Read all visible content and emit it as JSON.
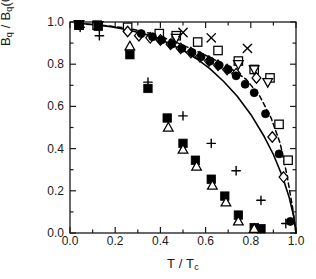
{
  "chart_data": {
    "type": "scatter",
    "title": "",
    "xlabel": "T / Tc",
    "ylabel": "Bq / Bq(0)",
    "xlabel_parts": {
      "num": "T",
      "den": "T",
      "den_sub": "c"
    },
    "ylabel_parts": {
      "num": "B",
      "num_sub": "q",
      "den": "B",
      "den_sub": "q",
      "den_arg": "(0)"
    },
    "xlim": [
      0.0,
      1.0
    ],
    "ylim": [
      0.0,
      1.0
    ],
    "xticks": [
      "0.0",
      "0.2",
      "0.4",
      "0.6",
      "0.8",
      "1.0"
    ],
    "xtick_values": [
      0.0,
      0.2,
      0.4,
      0.6,
      0.8,
      1.0
    ],
    "yticks": [
      "0.0",
      "0.2",
      "0.4",
      "0.6",
      "0.8",
      "1.0"
    ],
    "ytick_values": [
      0.0,
      0.2,
      0.4,
      0.6,
      0.8,
      1.0
    ],
    "minor_ticks": true,
    "grid": false,
    "legend": "none",
    "frame": "box",
    "axis_color": "#1a1a1a",
    "series": [
      {
        "name": "open-square",
        "marker": "square-open",
        "color": "#000000",
        "points": [
          [
            0.04,
            0.985
          ],
          [
            0.12,
            0.985
          ],
          [
            0.255,
            0.975
          ],
          [
            0.395,
            0.945
          ],
          [
            0.47,
            0.935
          ],
          [
            0.565,
            0.905
          ],
          [
            0.655,
            0.865
          ],
          [
            0.745,
            0.815
          ],
          [
            0.815,
            0.775
          ],
          [
            0.885,
            0.735
          ],
          [
            0.925,
            0.515
          ],
          [
            0.965,
            0.345
          ]
        ]
      },
      {
        "name": "open-triangle-down",
        "marker": "triangle-down-open",
        "color": "#000000",
        "points": [
          [
            0.04,
            0.99
          ],
          [
            0.125,
            0.985
          ],
          [
            0.47,
            0.925
          ],
          [
            0.745,
            0.8
          ],
          [
            0.815,
            0.775
          ],
          [
            0.875,
            0.715
          ]
        ]
      },
      {
        "name": "open-diamond",
        "marker": "diamond-open",
        "color": "#000000",
        "points": [
          [
            0.255,
            0.955
          ],
          [
            0.305,
            0.935
          ],
          [
            0.355,
            0.925
          ],
          [
            0.4,
            0.915
          ],
          [
            0.445,
            0.895
          ],
          [
            0.49,
            0.875
          ],
          [
            0.535,
            0.855
          ],
          [
            0.575,
            0.835
          ],
          [
            0.615,
            0.815
          ],
          [
            0.655,
            0.795
          ],
          [
            0.695,
            0.775
          ],
          [
            0.735,
            0.755
          ],
          [
            0.825,
            0.735
          ],
          [
            0.895,
            0.455
          ],
          [
            0.945,
            0.265
          ]
        ]
      },
      {
        "name": "filled-circle",
        "marker": "circle-filled",
        "color": "#000000",
        "points": [
          [
            0.315,
            0.945
          ],
          [
            0.365,
            0.93
          ],
          [
            0.405,
            0.915
          ],
          [
            0.45,
            0.895
          ],
          [
            0.495,
            0.875
          ],
          [
            0.54,
            0.855
          ],
          [
            0.58,
            0.835
          ],
          [
            0.62,
            0.815
          ],
          [
            0.66,
            0.795
          ],
          [
            0.7,
            0.775
          ],
          [
            0.735,
            0.745
          ],
          [
            0.775,
            0.705
          ],
          [
            0.815,
            0.665
          ],
          [
            0.865,
            0.565
          ],
          [
            0.925,
            0.375
          ],
          [
            0.975,
            0.055
          ]
        ]
      },
      {
        "name": "filled-square",
        "marker": "square-filled",
        "color": "#000000",
        "points": [
          [
            0.04,
            0.985
          ],
          [
            0.125,
            0.98
          ],
          [
            0.265,
            0.845
          ],
          [
            0.345,
            0.685
          ],
          [
            0.43,
            0.545
          ],
          [
            0.5,
            0.425
          ],
          [
            0.555,
            0.345
          ],
          [
            0.625,
            0.255
          ],
          [
            0.685,
            0.175
          ],
          [
            0.745,
            0.085
          ],
          [
            0.815,
            0.025
          ],
          [
            0.845,
            0.02
          ]
        ]
      },
      {
        "name": "open-triangle-up",
        "marker": "triangle-up-open",
        "color": "#000000",
        "points": [
          [
            0.265,
            0.885
          ],
          [
            0.435,
            0.5
          ],
          [
            0.5,
            0.395
          ],
          [
            0.56,
            0.315
          ],
          [
            0.63,
            0.225
          ],
          [
            0.69,
            0.145
          ],
          [
            0.745,
            0.055
          ],
          [
            0.815,
            0.02
          ]
        ]
      },
      {
        "name": "plus",
        "marker": "plus",
        "color": "#000000",
        "points": [
          [
            0.045,
            0.975
          ],
          [
            0.13,
            0.935
          ],
          [
            0.345,
            0.715
          ],
          [
            0.5,
            0.555
          ],
          [
            0.625,
            0.425
          ],
          [
            0.735,
            0.295
          ],
          [
            0.845,
            0.155
          ],
          [
            0.955,
            0.045
          ]
        ]
      },
      {
        "name": "cross",
        "marker": "x",
        "color": "#000000",
        "points": [
          [
            0.5,
            0.95
          ],
          [
            0.625,
            0.925
          ],
          [
            0.785,
            0.875
          ]
        ]
      }
    ],
    "lines": [
      {
        "name": "bcs-solid-curve",
        "style": "solid",
        "color": "#000000",
        "width": 1.6,
        "points": [
          [
            0.02,
            0.995
          ],
          [
            0.1,
            0.988
          ],
          [
            0.18,
            0.978
          ],
          [
            0.26,
            0.962
          ],
          [
            0.34,
            0.94
          ],
          [
            0.42,
            0.908
          ],
          [
            0.5,
            0.866
          ],
          [
            0.56,
            0.826
          ],
          [
            0.62,
            0.778
          ],
          [
            0.68,
            0.718
          ],
          [
            0.74,
            0.648
          ],
          [
            0.8,
            0.562
          ],
          [
            0.86,
            0.456
          ],
          [
            0.9,
            0.372
          ],
          [
            0.94,
            0.268
          ],
          [
            0.97,
            0.168
          ],
          [
            0.99,
            0.078
          ],
          [
            1.0,
            0.0
          ]
        ]
      },
      {
        "name": "dashed-upper-curve",
        "style": "dashed",
        "color": "#000000",
        "width": 1.5,
        "points": [
          [
            0.04,
            0.992
          ],
          [
            0.14,
            0.985
          ],
          [
            0.26,
            0.97
          ],
          [
            0.36,
            0.945
          ],
          [
            0.45,
            0.912
          ],
          [
            0.54,
            0.872
          ],
          [
            0.62,
            0.832
          ],
          [
            0.7,
            0.788
          ],
          [
            0.78,
            0.728
          ],
          [
            0.84,
            0.648
          ],
          [
            0.89,
            0.545
          ],
          [
            0.93,
            0.425
          ],
          [
            0.96,
            0.275
          ],
          [
            0.985,
            0.12
          ],
          [
            1.0,
            0.0
          ]
        ]
      }
    ]
  }
}
